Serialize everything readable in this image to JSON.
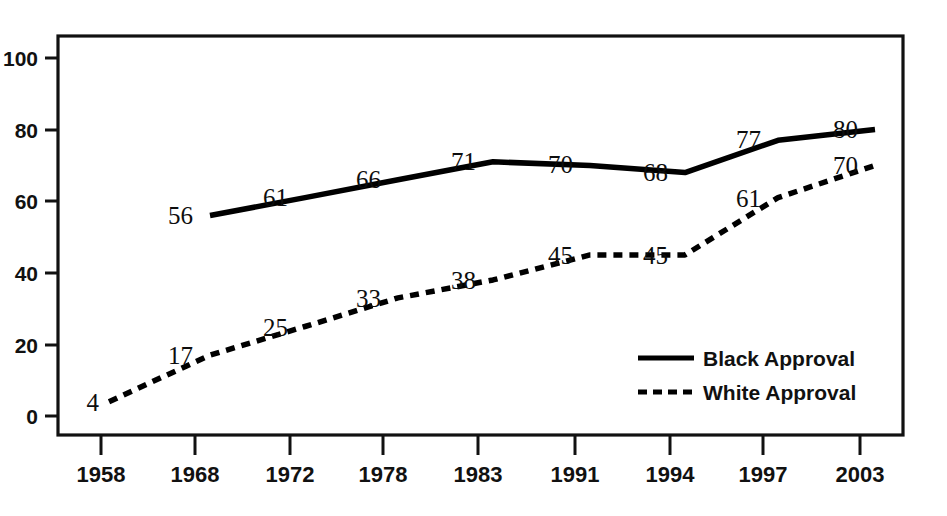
{
  "chart_data": {
    "type": "line",
    "title": "",
    "subtitle": "",
    "xlabel": "",
    "ylabel": "",
    "categories": [
      "1958",
      "1968",
      "1972",
      "1978",
      "1983",
      "1991",
      "1994",
      "1997",
      "2003"
    ],
    "ylim": [
      0,
      100
    ],
    "xlim_categories": [
      "1958",
      "2003"
    ],
    "y_ticks": [
      "0",
      "20",
      "40",
      "60",
      "80",
      "100"
    ],
    "y_tick_values": [
      0,
      20,
      40,
      60,
      80,
      100
    ],
    "grid": false,
    "legend_position": "inside-lower-right",
    "series": [
      {
        "name": "Black Approval",
        "style": "solid",
        "color": "#000000",
        "x": [
          "1968",
          "1972",
          "1978",
          "1983",
          "1991",
          "1994",
          "1997",
          "2003"
        ],
        "values": [
          56,
          61,
          66,
          71,
          70,
          68,
          77,
          80
        ],
        "labels": [
          "56",
          "61",
          "66",
          "71",
          "70",
          "68",
          "77",
          "80"
        ]
      },
      {
        "name": "White Approval",
        "style": "dashed",
        "color": "#000000",
        "x": [
          "1958",
          "1968",
          "1972",
          "1978",
          "1983",
          "1991",
          "1994",
          "1997",
          "2003"
        ],
        "values": [
          4,
          17,
          25,
          33,
          38,
          45,
          45,
          61,
          70
        ],
        "labels": [
          "4",
          "17",
          "25",
          "33",
          "38",
          "45",
          "45",
          "61",
          "70"
        ]
      }
    ],
    "annotations": []
  },
  "axes": {
    "y_tick_labels": [
      "100",
      "80",
      "60",
      "40",
      "20",
      "0"
    ],
    "x_tick_labels": [
      "1958",
      "1968",
      "1972",
      "1978",
      "1983",
      "1991",
      "1994",
      "1997",
      "2003"
    ]
  },
  "legend": {
    "entries": [
      {
        "label": "Black Approval",
        "style": "solid"
      },
      {
        "label": "White Approval",
        "style": "dashed"
      }
    ]
  },
  "point_labels": {
    "black": [
      "56",
      "61",
      "66",
      "71",
      "70",
      "68",
      "77",
      "80"
    ],
    "white": [
      "4",
      "17",
      "25",
      "33",
      "38",
      "45",
      "45",
      "61",
      "70"
    ]
  },
  "colors": {
    "line": "#000000",
    "frame": "#111111",
    "text": "#111111",
    "background": "#ffffff"
  }
}
